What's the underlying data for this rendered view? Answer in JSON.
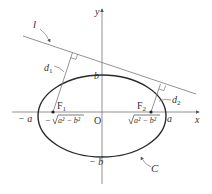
{
  "diagram": {
    "type": "ellipse-foci-tangent",
    "colors": {
      "curve": "#2a2a2a",
      "lines": "#6a6a6a",
      "text": "#333333"
    },
    "labels": {
      "line_l": "l",
      "d1": "d",
      "d1_sub": "1",
      "d2": "d",
      "d2_sub": "2",
      "y_axis": "y",
      "x_axis": "x",
      "b": "b",
      "neg_b": "− b",
      "origin": "O",
      "F1": "F",
      "F1_sub": "1",
      "F2": "F",
      "F2_sub": "2",
      "neg_a": "− a",
      "a": "a",
      "neg_c": "− √a² − b²",
      "neg_c_prefix": "−",
      "c_radicand": "a² − b²",
      "curve_C": "C"
    }
  }
}
